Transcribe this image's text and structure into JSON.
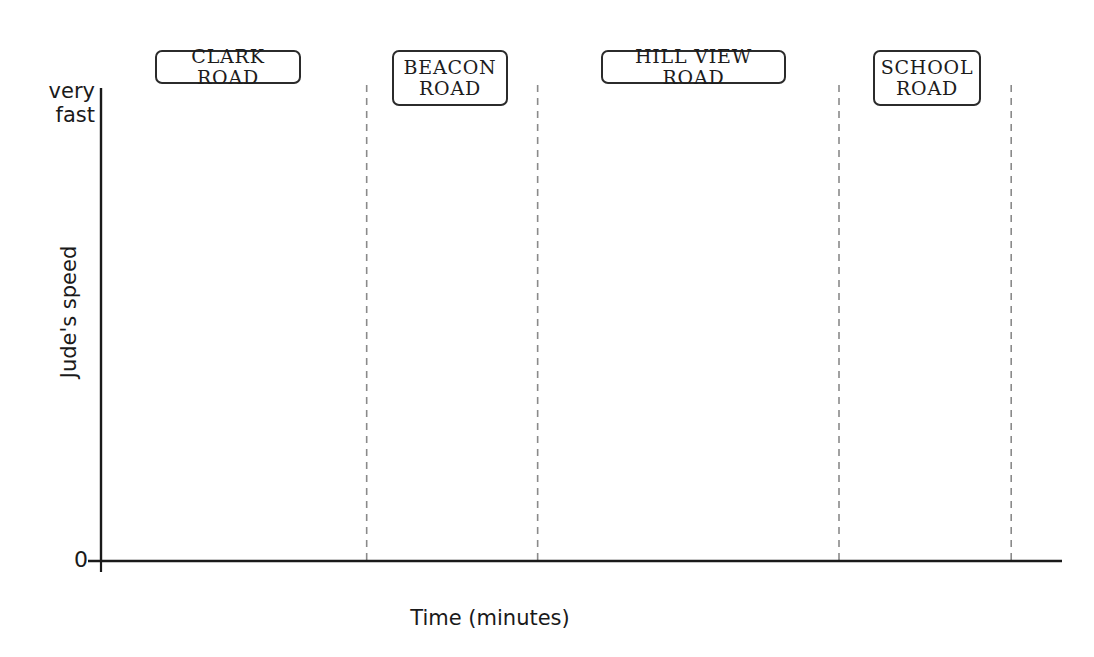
{
  "figure": {
    "width": 1094,
    "height": 657,
    "background": "#ffffff",
    "line_color": "#1a1a1a",
    "axis_color": "#1a1a1a",
    "dashed_color": "#8a8a8a"
  },
  "axes": {
    "y_top_label": "very\nfast",
    "y_zero_label": "0",
    "y_title": "Jude's speed",
    "x_title": "Time (minutes)",
    "x_tick_labels": [
      "0",
      "1",
      "2",
      "3",
      "4",
      "5",
      "6",
      "7"
    ]
  },
  "road_signs": [
    {
      "label": "CLARK ROAD",
      "lines": 1,
      "left": 155,
      "top": 50,
      "width": 146,
      "height": 34
    },
    {
      "label": "BEACON\nROAD",
      "lines": 2,
      "left": 392,
      "top": 50,
      "width": 116,
      "height": 56
    },
    {
      "label": "HILL VIEW ROAD",
      "lines": 1,
      "left": 601,
      "top": 50,
      "width": 185,
      "height": 34
    },
    {
      "label": "SCHOOL\nROAD",
      "lines": 2,
      "left": 873,
      "top": 50,
      "width": 108,
      "height": 56
    }
  ],
  "chart_data": {
    "type": "line",
    "title": "",
    "xlabel": "Time (minutes)",
    "ylabel": "Jude's speed",
    "xlim": [
      0,
      7.8
    ],
    "ylim": [
      0,
      1
    ],
    "xticks": [
      0,
      1,
      2,
      3,
      4,
      5,
      6,
      7
    ],
    "yticks": [
      0
    ],
    "ytick_labels": [
      "0"
    ],
    "y_axis_top_label": "very fast",
    "grid": false,
    "legend": "none",
    "section_boundaries_minutes": [
      2.16,
      3.55,
      6.0,
      7.4
    ],
    "section_boundary_style": "dashed",
    "sections": [
      {
        "name": "CLARK ROAD",
        "start_minutes": 0.0,
        "end_minutes": 2.16,
        "plateau_speed": 0.2
      },
      {
        "name": "BEACON ROAD",
        "start_minutes": 2.16,
        "end_minutes": 3.55,
        "plateau_speed": 0.545
      },
      {
        "name": "HILL VIEW ROAD",
        "start_minutes": 3.55,
        "end_minutes": 6.0,
        "plateau_speed": 0.92
      },
      {
        "name": "SCHOOL ROAD",
        "start_minutes": 6.0,
        "end_minutes": 7.4,
        "plateau_speed": 0.68
      }
    ],
    "series": [
      {
        "name": "Jude's speed",
        "points": [
          {
            "x": 0.0,
            "y": 0.0
          },
          {
            "x": 0.1,
            "y": 0.055
          },
          {
            "x": 0.25,
            "y": 0.105
          },
          {
            "x": 0.45,
            "y": 0.15
          },
          {
            "x": 0.7,
            "y": 0.187
          },
          {
            "x": 0.9,
            "y": 0.2
          },
          {
            "x": 1.2,
            "y": 0.202
          },
          {
            "x": 1.6,
            "y": 0.201
          },
          {
            "x": 1.85,
            "y": 0.198
          },
          {
            "x": 1.95,
            "y": 0.18
          },
          {
            "x": 2.0,
            "y": 0.12
          },
          {
            "x": 2.03,
            "y": 0.0
          },
          {
            "x": 2.16,
            "y": 0.0
          },
          {
            "x": 2.22,
            "y": 0.11
          },
          {
            "x": 2.32,
            "y": 0.3
          },
          {
            "x": 2.45,
            "y": 0.43
          },
          {
            "x": 2.6,
            "y": 0.505
          },
          {
            "x": 2.8,
            "y": 0.538
          },
          {
            "x": 3.1,
            "y": 0.545
          },
          {
            "x": 3.45,
            "y": 0.546
          },
          {
            "x": 3.6,
            "y": 0.552
          },
          {
            "x": 3.75,
            "y": 0.6
          },
          {
            "x": 3.9,
            "y": 0.72
          },
          {
            "x": 4.05,
            "y": 0.83
          },
          {
            "x": 4.25,
            "y": 0.89
          },
          {
            "x": 4.55,
            "y": 0.91
          },
          {
            "x": 5.0,
            "y": 0.922
          },
          {
            "x": 5.45,
            "y": 0.918
          },
          {
            "x": 5.85,
            "y": 0.908
          },
          {
            "x": 6.0,
            "y": 0.9
          },
          {
            "x": 6.1,
            "y": 0.84
          },
          {
            "x": 6.2,
            "y": 0.74
          },
          {
            "x": 6.32,
            "y": 0.692
          },
          {
            "x": 6.5,
            "y": 0.678
          },
          {
            "x": 6.9,
            "y": 0.677
          },
          {
            "x": 7.25,
            "y": 0.68
          },
          {
            "x": 7.38,
            "y": 0.668
          },
          {
            "x": 7.45,
            "y": 0.6
          },
          {
            "x": 7.55,
            "y": 0.4
          },
          {
            "x": 7.68,
            "y": 0.17
          },
          {
            "x": 7.76,
            "y": 0.0
          }
        ]
      }
    ]
  }
}
